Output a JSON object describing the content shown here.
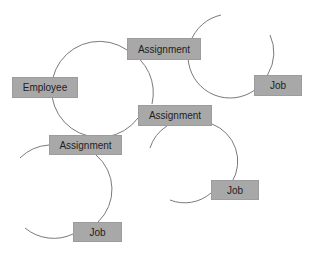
{
  "diagram": {
    "line_color": "#7a7a7a",
    "node_fill": "#a8a8a8",
    "text_color": "#1e1e1e",
    "nodes": [
      {
        "id": "employee",
        "label": "Employee",
        "x": 12,
        "y": 77,
        "w": 66,
        "h": 21
      },
      {
        "id": "assignment-top",
        "label": "Assignment",
        "x": 127,
        "y": 38,
        "w": 74,
        "h": 22
      },
      {
        "id": "job-top-right",
        "label": "Job",
        "x": 254,
        "y": 75,
        "w": 48,
        "h": 21
      },
      {
        "id": "assignment-middle",
        "label": "Assignment",
        "x": 138,
        "y": 105,
        "w": 74,
        "h": 21
      },
      {
        "id": "assignment-lower-left",
        "label": "Assignment",
        "x": 49,
        "y": 135,
        "w": 73,
        "h": 20
      },
      {
        "id": "job-middle-right",
        "label": "Job",
        "x": 211,
        "y": 180,
        "w": 48,
        "h": 20
      },
      {
        "id": "job-bottom",
        "label": "Job",
        "x": 73,
        "y": 222,
        "w": 49,
        "h": 20
      }
    ],
    "arcs": [
      {
        "id": "arc-employee-cycle",
        "d": "M 127 50 A 48 48 0 1 0 138 118"
      },
      {
        "id": "arc-employee-cycle-b",
        "d": "M 127 50 A 48 48 0 0 1 152 104"
      },
      {
        "id": "arc-top-right",
        "d": "M 221 15 A 42 42 0 1 0 268 74"
      },
      {
        "id": "arc-top-right-b",
        "d": "M 268 74 A 42 42 0 0 0 270 35"
      },
      {
        "id": "arc-middle-right",
        "d": "M 150 148 A 40 40 0 0 1 167 126"
      },
      {
        "id": "arc-middle-right-b",
        "d": "M 212 124 A 40 40 0 0 1 232 182"
      },
      {
        "id": "arc-middle-right-c",
        "d": "M 211 193 A 40 40 0 0 1 170 200"
      },
      {
        "id": "arc-lower-left",
        "d": "M 20 158 A 45 45 0 0 1 49 145"
      },
      {
        "id": "arc-lower-left-b",
        "d": "M 96 155 A 45 45 0 0 1 98 222"
      },
      {
        "id": "arc-lower-left-c",
        "d": "M 73 234 A 45 45 0 0 1 25 228"
      }
    ]
  }
}
